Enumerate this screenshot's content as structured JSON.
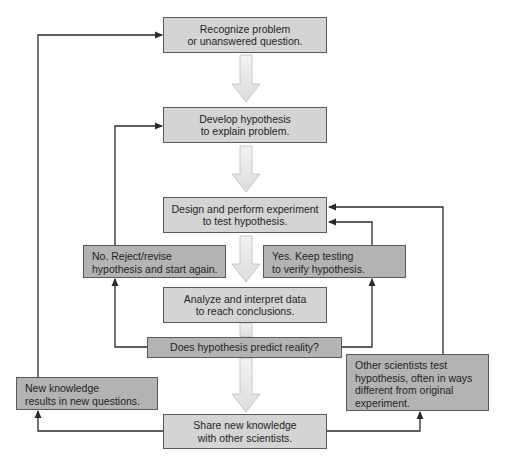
{
  "diagram": {
    "colors": {
      "main_box": "#d4d4d4",
      "side_box": "#b3b3b3",
      "border": "#5a5a5a",
      "connector": "#2a2a2a",
      "flow_arrow": "#e8e8e8"
    },
    "nodes": {
      "recognize": {
        "lines": [
          "Recognize problem",
          "or unanswered question."
        ]
      },
      "develop": {
        "lines": [
          "Develop hypothesis",
          "to explain problem."
        ]
      },
      "design": {
        "lines": [
          "Design and perform experiment",
          "to test hypothesis."
        ]
      },
      "reject": {
        "lines": [
          "No. Reject/revise",
          "hypothesis and start again."
        ]
      },
      "keep_testing": {
        "lines": [
          "Yes. Keep testing",
          "to verify hypothesis."
        ]
      },
      "analyze": {
        "lines": [
          "Analyze and interpret data",
          "to reach conclusions."
        ]
      },
      "decision": {
        "lines": [
          "Does hypothesis predict reality?"
        ]
      },
      "new_knowledge": {
        "lines": [
          "New knowledge",
          "results in new questions."
        ]
      },
      "other_scientists": {
        "lines": [
          "Other scientists test",
          "hypothesis, often in ways",
          "different from original",
          "experiment."
        ]
      },
      "share": {
        "lines": [
          "Share new knowledge",
          "with other scientists."
        ]
      }
    },
    "edges": [
      {
        "from": "recognize",
        "to": "develop",
        "style": "hollow"
      },
      {
        "from": "develop",
        "to": "design",
        "style": "hollow"
      },
      {
        "from": "design",
        "to": "analyze",
        "style": "hollow"
      },
      {
        "from": "analyze",
        "to": "decision",
        "style": "hollow"
      },
      {
        "from": "decision",
        "to": "share",
        "style": "hollow"
      },
      {
        "from": "decision",
        "to": "reject",
        "label": "No",
        "style": "line"
      },
      {
        "from": "reject",
        "to": "develop",
        "style": "line"
      },
      {
        "from": "decision",
        "to": "keep_testing",
        "label": "Yes",
        "style": "line"
      },
      {
        "from": "keep_testing",
        "to": "design",
        "style": "line"
      },
      {
        "from": "share",
        "to": "new_knowledge",
        "style": "line"
      },
      {
        "from": "new_knowledge",
        "to": "recognize",
        "style": "line"
      },
      {
        "from": "share",
        "to": "other_scientists",
        "style": "line"
      },
      {
        "from": "other_scientists",
        "to": "design",
        "style": "line"
      }
    ]
  }
}
